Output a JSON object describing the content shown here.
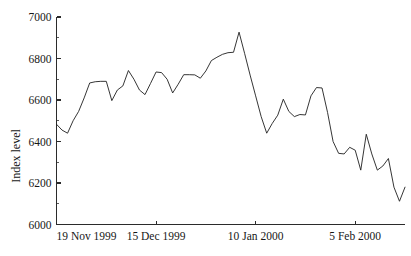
{
  "chart_data": {
    "type": "line",
    "title": "",
    "subtitle": "",
    "xlabel": "",
    "ylabel": "Index level",
    "ylim": [
      6000,
      7000
    ],
    "ytick_values": [
      6000,
      6200,
      6400,
      6600,
      6800,
      7000
    ],
    "ytick_labels": [
      "6000",
      "6200",
      "6400",
      "6600",
      "6800",
      "7000"
    ],
    "yminor_values": [
      6100,
      6300,
      6500,
      6700,
      6900
    ],
    "xtick_labels": [
      "19 Nov 1999",
      "15 Dec 1999",
      "10 Jan 2000",
      "5 Feb 2000"
    ],
    "xtick_index": [
      0,
      18,
      36,
      54
    ],
    "xlim_index": [
      0,
      63
    ],
    "grid": false,
    "legend": null,
    "series": [
      {
        "name": "Index level",
        "color": "#1f1f1f",
        "x": [
          0,
          1,
          2,
          3,
          4,
          5,
          6,
          7,
          8,
          9,
          10,
          11,
          12,
          13,
          14,
          15,
          16,
          17,
          18,
          19,
          20,
          21,
          22,
          23,
          24,
          25,
          26,
          27,
          28,
          29,
          30,
          31,
          32,
          33,
          34,
          35,
          36,
          37,
          38,
          39,
          40,
          41,
          42,
          43,
          44,
          45,
          46,
          47,
          48,
          49,
          50,
          51,
          52,
          53,
          54,
          55,
          56,
          57,
          58,
          59,
          60,
          61,
          62,
          63
        ],
        "values": [
          6483,
          6455,
          6440,
          6500,
          6545,
          6610,
          6682,
          6688,
          6690,
          6690,
          6597,
          6648,
          6668,
          6742,
          6700,
          6648,
          6626,
          6680,
          6735,
          6732,
          6700,
          6634,
          6676,
          6722,
          6722,
          6721,
          6705,
          6740,
          6790,
          6806,
          6820,
          6828,
          6830,
          6927,
          6825,
          6720,
          6620,
          6520,
          6440,
          6487,
          6527,
          6604,
          6545,
          6520,
          6530,
          6528,
          6620,
          6660,
          6658,
          6540,
          6400,
          6343,
          6340,
          6372,
          6358,
          6262,
          6435,
          6340,
          6262,
          6282,
          6318,
          6180,
          6112,
          6180
        ],
        "annotations": []
      }
    ]
  },
  "axis": {
    "ylabel": "Index level",
    "ytick_labels": [
      "7000",
      "6800",
      "6600",
      "6400",
      "6200",
      "6000"
    ],
    "xtick_labels": [
      "19 Nov 1999",
      "15 Dec 1999",
      "10 Jan 2000",
      "5 Feb 2000"
    ]
  }
}
